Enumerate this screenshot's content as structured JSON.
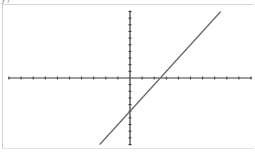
{
  "header": {
    "clipped_label": "y)"
  },
  "colors": {
    "axis": "#3a3a3a",
    "line": "#6a6a6a",
    "frame": "#d0d0d0",
    "background": "#ffffff"
  },
  "chart_data": {
    "type": "line",
    "title": "",
    "xlabel": "",
    "ylabel": "",
    "xlim": [
      -10,
      10
    ],
    "ylim": [
      -10,
      10
    ],
    "xscale_tick": 1,
    "yscale_tick": 1,
    "grid": false,
    "legend": null,
    "series": [
      {
        "name": "y = 2x - 5",
        "equation": "y = 2x - 5",
        "x": [
          -2.5,
          7.5
        ],
        "y": [
          -10,
          10
        ]
      }
    ],
    "annotations": [],
    "intercepts": {
      "x_intercept": 2.5,
      "y_intercept": -5
    }
  }
}
